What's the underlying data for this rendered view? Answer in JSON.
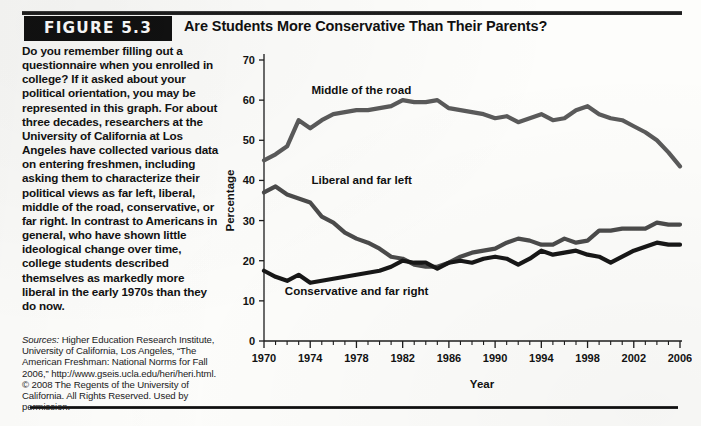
{
  "figure": {
    "tag_label": "FIGURE 5.3",
    "title": "Are Students More Conservative Than Their Parents?",
    "body_text": "Do you remember filling out a questionnaire when you enrolled in college? If it asked about your political orientation, you may be represented in this graph. For about three decades, researchers at the University of California at Los Angeles have collected various data on entering freshmen, including asking them to characterize their political views as far left, liberal, middle of the road, conservative, or far right. In contrast to Americans in general, who have shown little ideological change over time, college students described themselves as markedly more liberal in the early 1970s than they do now.",
    "sources_label": "Sources:",
    "sources_text": "Higher Education Research Institute, University of California, Los Angeles, “The American Freshman: National Norms for Fall 2006,” http://www.gseis.ucla.edu/heri/heri.html. © 2008 The Regents of the University of California. All Rights Reserved. Used by permission."
  },
  "chart_data": {
    "type": "line",
    "title": "",
    "xlabel": "Year",
    "ylabel": "Percentage",
    "xlim": [
      1970,
      2006
    ],
    "ylim": [
      0,
      70
    ],
    "ytick_labels": [
      "0",
      "10",
      "20",
      "30",
      "40",
      "50",
      "60",
      "70"
    ],
    "yticks": [
      0,
      10,
      20,
      30,
      40,
      50,
      60,
      70
    ],
    "xtick_labels": [
      "1970",
      "1974",
      "1978",
      "1982",
      "1986",
      "1990",
      "1994",
      "1998",
      "2002",
      "2006"
    ],
    "xticks_major": [
      1970,
      1974,
      1978,
      1982,
      1986,
      1990,
      1994,
      1998,
      2002,
      2006
    ],
    "grid": false,
    "legend_position": "inline-labels",
    "x": [
      1970,
      1971,
      1972,
      1973,
      1974,
      1975,
      1976,
      1977,
      1978,
      1979,
      1980,
      1981,
      1982,
      1983,
      1984,
      1985,
      1986,
      1987,
      1988,
      1989,
      1990,
      1991,
      1992,
      1993,
      1994,
      1995,
      1996,
      1997,
      1998,
      1999,
      2000,
      2001,
      2002,
      2003,
      2004,
      2005,
      2006
    ],
    "series": [
      {
        "name": "Middle of the road",
        "color": "#5a5a5a",
        "label_xy": [
          1974.1,
          61.5
        ],
        "values": [
          45.0,
          46.5,
          48.5,
          55.0,
          53.0,
          55.0,
          56.5,
          57.0,
          57.5,
          57.5,
          58.0,
          58.5,
          60.0,
          59.5,
          59.5,
          60.0,
          58.0,
          57.5,
          57.0,
          56.5,
          55.5,
          56.0,
          54.5,
          55.5,
          56.5,
          55.0,
          55.5,
          57.5,
          58.5,
          56.5,
          55.5,
          55.0,
          53.5,
          52.0,
          50.0,
          47.0,
          43.5
        ]
      },
      {
        "name": "Liberal and far left",
        "color": "#4b4b4b",
        "label_xy": [
          1974.1,
          39.0
        ],
        "values": [
          37.0,
          38.5,
          36.5,
          35.5,
          34.5,
          31.0,
          29.5,
          27.0,
          25.5,
          24.5,
          23.0,
          21.0,
          20.5,
          19.0,
          18.5,
          18.5,
          19.5,
          21.0,
          22.0,
          22.5,
          23.0,
          24.5,
          25.5,
          25.0,
          24.0,
          24.0,
          25.5,
          24.5,
          25.0,
          27.5,
          27.5,
          28.0,
          28.0,
          28.0,
          29.5,
          29.0,
          29.0
        ]
      },
      {
        "name": "Conservative and far right",
        "color": "#171717",
        "label_xy": [
          1971.8,
          11.5
        ],
        "values": [
          17.5,
          16.0,
          15.0,
          16.5,
          14.5,
          15.0,
          15.5,
          16.0,
          16.5,
          17.0,
          17.5,
          18.5,
          20.0,
          19.5,
          19.5,
          18.0,
          19.5,
          20.0,
          19.5,
          20.5,
          21.0,
          20.5,
          19.0,
          20.5,
          22.5,
          21.5,
          22.0,
          22.5,
          21.5,
          21.0,
          19.5,
          21.0,
          22.5,
          23.5,
          24.5,
          24.0,
          24.0
        ]
      }
    ]
  }
}
